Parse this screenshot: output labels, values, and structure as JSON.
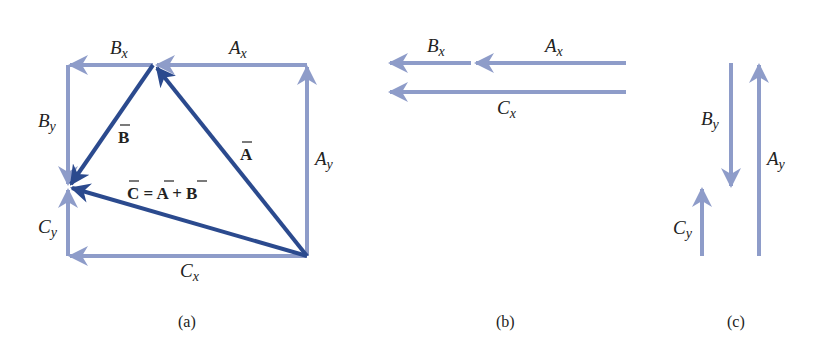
{
  "colors": {
    "component": "#8e9cc9",
    "vector": "#2b4a8e",
    "text": "#222222",
    "background": "#ffffff"
  },
  "panel_a": {
    "caption": "(a)",
    "labels": {
      "Bx": {
        "main": "B",
        "sub": "x"
      },
      "Ax": {
        "main": "A",
        "sub": "x"
      },
      "By": {
        "main": "B",
        "sub": "y"
      },
      "Ay": {
        "main": "A",
        "sub": "y"
      },
      "Cy": {
        "main": "C",
        "sub": "y"
      },
      "Cx": {
        "main": "C",
        "sub": "x"
      },
      "vecB": "B",
      "vecA": "A",
      "sum": {
        "C": "C",
        "eq": " = ",
        "A": "A",
        "plus": " + ",
        "B": "B"
      }
    }
  },
  "panel_b": {
    "caption": "(b)",
    "labels": {
      "Bx": {
        "main": "B",
        "sub": "x"
      },
      "Ax": {
        "main": "A",
        "sub": "x"
      },
      "Cx": {
        "main": "C",
        "sub": "x"
      }
    }
  },
  "panel_c": {
    "caption": "(c)",
    "labels": {
      "By": {
        "main": "B",
        "sub": "y"
      },
      "Ay": {
        "main": "A",
        "sub": "y"
      },
      "Cy": {
        "main": "C",
        "sub": "y"
      }
    }
  }
}
